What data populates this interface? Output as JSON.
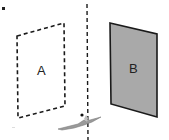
{
  "diagram": {
    "labels": {
      "image": "A",
      "object": "B"
    },
    "colors": {
      "background": "#ffffff",
      "stroke": "#1a1a1a",
      "object_fill": "#a9a9a9",
      "figure": "#8a8a8a"
    }
  }
}
